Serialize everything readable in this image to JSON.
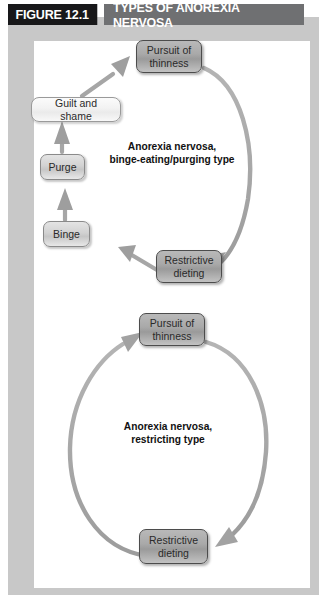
{
  "figure": {
    "number_label": "FIGURE 12.1",
    "title": "TYPES OF ANOREXIA NERVOSA",
    "colors": {
      "tag_background": "#18181a",
      "title_background": "#6f7072",
      "title_text": "#ffffff",
      "mat": "#c8c8c8",
      "canvas": "#ffffff",
      "arrow": "#a6a6a6",
      "node_border_dark": "#4c4c4c"
    }
  },
  "diagrams": [
    {
      "id": "binge-eating-purging-cycle",
      "caption": {
        "line1": "Anorexia nervosa,",
        "line2": "binge-eating/purging type"
      },
      "nodes": [
        {
          "id": "pursuit-of-thinness",
          "line1": "Pursuit of",
          "line2": "thinness",
          "style": "dark"
        },
        {
          "id": "restrictive-dieting",
          "line1": "Restrictive",
          "line2": "dieting",
          "style": "dark"
        },
        {
          "id": "binge",
          "line1": "Binge",
          "line2": "",
          "style": "mid"
        },
        {
          "id": "purge",
          "line1": "Purge",
          "line2": "",
          "style": "mid"
        },
        {
          "id": "guilt-and-shame",
          "line1": "Guilt and shame",
          "line2": "",
          "style": "light"
        }
      ],
      "edges": [
        {
          "from": "pursuit-of-thinness",
          "to": "restrictive-dieting"
        },
        {
          "from": "restrictive-dieting",
          "to": "binge"
        },
        {
          "from": "binge",
          "to": "purge"
        },
        {
          "from": "purge",
          "to": "guilt-and-shame"
        },
        {
          "from": "guilt-and-shame",
          "to": "pursuit-of-thinness"
        }
      ]
    },
    {
      "id": "restricting-cycle",
      "caption": {
        "line1": "Anorexia nervosa,",
        "line2": "restricting type"
      },
      "nodes": [
        {
          "id": "pursuit-of-thinness-2",
          "line1": "Pursuit of",
          "line2": "thinness",
          "style": "dark"
        },
        {
          "id": "restrictive-dieting-2",
          "line1": "Restrictive",
          "line2": "dieting",
          "style": "dark"
        }
      ],
      "edges": [
        {
          "from": "pursuit-of-thinness-2",
          "to": "restrictive-dieting-2"
        },
        {
          "from": "restrictive-dieting-2",
          "to": "pursuit-of-thinness-2"
        }
      ]
    }
  ]
}
